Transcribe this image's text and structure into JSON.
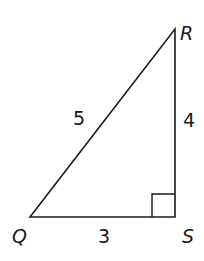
{
  "diagram": {
    "type": "right-triangle",
    "vertices": {
      "R": {
        "label": "R",
        "x": 175,
        "y": 29
      },
      "S": {
        "label": "S",
        "x": 175,
        "y": 217
      },
      "Q": {
        "label": "Q",
        "x": 30,
        "y": 217
      }
    },
    "sides": {
      "QR": {
        "label": "5"
      },
      "RS": {
        "label": "4"
      },
      "QS": {
        "label": "3"
      }
    },
    "right_angle_at": "S",
    "line_color": "#1a1a1a"
  }
}
